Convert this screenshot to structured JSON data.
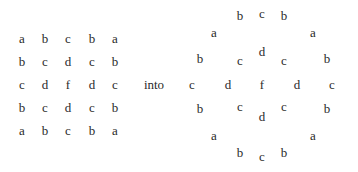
{
  "left_grid": {
    "rows": [
      [
        "a",
        "b",
        "c",
        "b",
        "a"
      ],
      [
        "b",
        "c",
        "d",
        "c",
        "b"
      ],
      [
        "c",
        "d",
        "f",
        "d",
        "c"
      ],
      [
        "b",
        "c",
        "d",
        "c",
        "b"
      ],
      [
        "a",
        "b",
        "c",
        "b",
        "a"
      ]
    ]
  },
  "connector": "into",
  "right_figure": {
    "letters": [
      {
        "t": "b",
        "x": 240,
        "y": 15
      },
      {
        "t": "c",
        "x": 262,
        "y": 13
      },
      {
        "t": "b",
        "x": 284,
        "y": 15
      },
      {
        "t": "a",
        "x": 214,
        "y": 32
      },
      {
        "t": "a",
        "x": 313,
        "y": 32
      },
      {
        "t": "d",
        "x": 262,
        "y": 51
      },
      {
        "t": "b",
        "x": 200,
        "y": 58
      },
      {
        "t": "c",
        "x": 240,
        "y": 60
      },
      {
        "t": "c",
        "x": 284,
        "y": 60
      },
      {
        "t": "b",
        "x": 327,
        "y": 58
      },
      {
        "t": "c",
        "x": 192,
        "y": 84
      },
      {
        "t": "d",
        "x": 228,
        "y": 84
      },
      {
        "t": "f",
        "x": 262,
        "y": 84
      },
      {
        "t": "d",
        "x": 297,
        "y": 84
      },
      {
        "t": "c",
        "x": 332,
        "y": 84
      },
      {
        "t": "b",
        "x": 200,
        "y": 108
      },
      {
        "t": "c",
        "x": 240,
        "y": 106
      },
      {
        "t": "c",
        "x": 284,
        "y": 106
      },
      {
        "t": "b",
        "x": 327,
        "y": 108
      },
      {
        "t": "d",
        "x": 262,
        "y": 116
      },
      {
        "t": "a",
        "x": 214,
        "y": 135
      },
      {
        "t": "a",
        "x": 313,
        "y": 135
      },
      {
        "t": "b",
        "x": 240,
        "y": 152
      },
      {
        "t": "c",
        "x": 262,
        "y": 156
      },
      {
        "t": "b",
        "x": 284,
        "y": 152
      }
    ]
  }
}
